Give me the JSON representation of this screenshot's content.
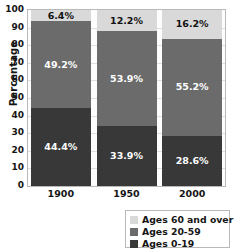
{
  "chart_data": {
    "type": "bar",
    "subtype": "stacked-bar-100-percent",
    "title": "",
    "xlabel": "",
    "ylabel": "Percentage",
    "ylim": [
      0,
      100
    ],
    "yticks": [
      0,
      10,
      20,
      30,
      40,
      50,
      60,
      70,
      80,
      90,
      100
    ],
    "ytick_labels": [
      "0",
      "10",
      "20",
      "30",
      "40",
      "50",
      "60",
      "70",
      "80",
      "90",
      "100"
    ],
    "categories": [
      "1900",
      "1950",
      "2000"
    ],
    "grid": true,
    "legend_position": "bottom-right",
    "series": [
      {
        "name": "Ages 0-19",
        "color": "#383838",
        "values": [
          44.4,
          33.9,
          28.6
        ],
        "labels": [
          "44.4%",
          "33.9%",
          "28.6%"
        ]
      },
      {
        "name": "Ages 20-59",
        "color": "#6b6b6b",
        "values": [
          49.2,
          53.9,
          55.2
        ],
        "labels": [
          "49.2%",
          "53.9%",
          "55.2%"
        ]
      },
      {
        "name": "Ages 60 and over",
        "color": "#d9d9d9",
        "values": [
          6.4,
          12.2,
          16.2
        ],
        "labels": [
          "6.4%",
          "12.2%",
          "16.2%"
        ]
      }
    ]
  },
  "axis": {
    "y_title": "Percentage",
    "y_ticks": [
      "100",
      "90",
      "80",
      "70",
      "60",
      "50",
      "40",
      "30",
      "20",
      "10",
      "0"
    ],
    "x_ticks": [
      "1900",
      "1950",
      "2000"
    ]
  },
  "bars": [
    {
      "category": "1900",
      "young_label": "44.4%",
      "mid_label": "49.2%",
      "old_label": "6.4%"
    },
    {
      "category": "1950",
      "young_label": "33.9%",
      "mid_label": "53.9%",
      "old_label": "12.2%"
    },
    {
      "category": "2000",
      "young_label": "28.6%",
      "mid_label": "55.2%",
      "old_label": "16.2%"
    }
  ],
  "legend": {
    "items": [
      {
        "label": "Ages 60 and over",
        "color": "#d9d9d9"
      },
      {
        "label": "Ages 20-59",
        "color": "#6b6b6b"
      },
      {
        "label": "Ages 0-19",
        "color": "#383838"
      }
    ]
  },
  "colors": {
    "ages_0_19": "#383838",
    "ages_20_59": "#6b6b6b",
    "ages_60_over": "#d9d9d9",
    "axis": "#141414",
    "grid": "#dedede",
    "frame": "#b9b9b9"
  }
}
